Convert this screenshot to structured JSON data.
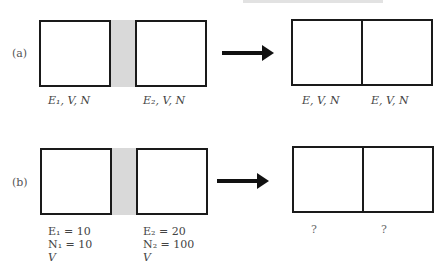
{
  "panels": [
    {
      "label": "(a)",
      "initial": {
        "left_label": "E₁, V, N",
        "right_label": "E₂, V, N",
        "partition": "gray insulating wall"
      },
      "final": {
        "left_label": "E, V, N",
        "right_label": "E, V, N"
      }
    },
    {
      "label": "(b)",
      "initial": {
        "left_values": [
          "E₁ = 10",
          "N₁ = 10",
          "V"
        ],
        "right_values": [
          "E₂ = 20",
          "N₂ = 100",
          "V"
        ],
        "partition": "gray insulating wall"
      },
      "final": {
        "left_label": "?",
        "right_label": "?"
      }
    }
  ],
  "arrow_icon": "right-arrow",
  "colors": {
    "stroke": "#1a1a1a",
    "partition_fill": "#d9d9d9",
    "background": "#ffffff"
  }
}
